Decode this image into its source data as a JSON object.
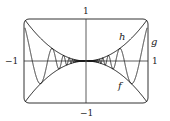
{
  "chart_data": {
    "type": "line",
    "title": "",
    "xlabel": "",
    "ylabel": "",
    "xlim": [
      -1,
      1
    ],
    "ylim": [
      -1,
      1
    ],
    "grid": false,
    "legend": "inline labels",
    "tick_labels": {
      "x_left": "−1",
      "x_right": "1",
      "y_top": "1",
      "y_bottom": "−1"
    },
    "series": [
      {
        "name": "h",
        "label": "h",
        "expression": "x^2",
        "role": "upper envelope"
      },
      {
        "name": "f",
        "label": "f",
        "expression": "-x^2",
        "role": "lower envelope"
      },
      {
        "name": "g",
        "label": "g",
        "expression": "x^2 sin(1/x^?) oscillating between f and h",
        "role": "oscillating function"
      }
    ],
    "annotations": [
      {
        "text": "h",
        "x": 0.58,
        "y": 0.6
      },
      {
        "text": "g",
        "x": 1.08,
        "y": 0.45
      },
      {
        "text": "f",
        "x": 0.57,
        "y": -0.6
      }
    ]
  },
  "colors": {
    "curve": "#1a1a1a",
    "axis": "#333333",
    "frame": "#333333"
  }
}
